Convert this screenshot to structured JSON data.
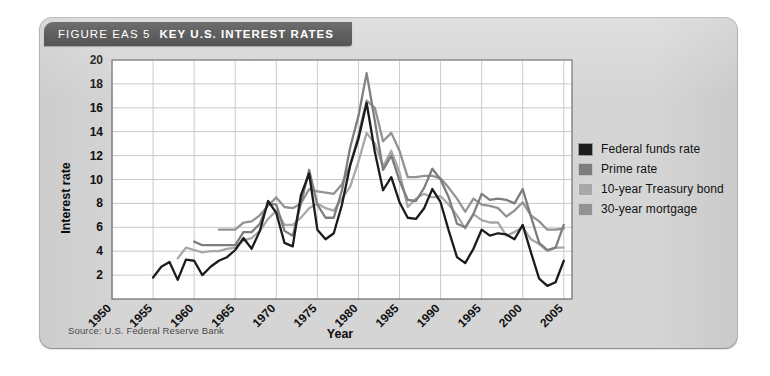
{
  "figure": {
    "label": "FIGURE EAS 5",
    "title": "KEY U.S. INTEREST RATES",
    "source": "Source: U.S. Federal Reserve Bank",
    "card_color": "#d5d5d5",
    "titlebar_color": "#5e5e5e",
    "plot_background": "#ffffff"
  },
  "legend": {
    "position": "right",
    "items": [
      {
        "label": "Federal funds rate",
        "color": "#1c1c1c"
      },
      {
        "label": "Prime rate",
        "color": "#7d7d7d"
      },
      {
        "label": "10-year Treasury bond",
        "color": "#a8a8a8"
      },
      {
        "label": "30-year mortgage",
        "color": "#929292"
      }
    ]
  },
  "chart_data": {
    "type": "line",
    "title": "KEY U.S. INTEREST RATES",
    "xlabel": "Year",
    "ylabel": "Interest rate",
    "xlim": [
      1950,
      2006
    ],
    "ylim": [
      0,
      20
    ],
    "grid": true,
    "xticks": [
      1950,
      1955,
      1960,
      1965,
      1970,
      1975,
      1980,
      1985,
      1990,
      1995,
      2000,
      2005
    ],
    "yticks": [
      2,
      4,
      6,
      8,
      10,
      12,
      14,
      16,
      18,
      20
    ],
    "xtick_rotation": 45,
    "series": [
      {
        "name": "Federal funds rate",
        "color": "#1c1c1c",
        "x": [
          1955,
          1956,
          1957,
          1958,
          1959,
          1960,
          1961,
          1962,
          1963,
          1964,
          1965,
          1966,
          1967,
          1968,
          1969,
          1970,
          1971,
          1972,
          1973,
          1974,
          1975,
          1976,
          1977,
          1978,
          1979,
          1980,
          1981,
          1982,
          1983,
          1984,
          1985,
          1986,
          1987,
          1988,
          1989,
          1990,
          1991,
          1992,
          1993,
          1994,
          1995,
          1996,
          1997,
          1998,
          1999,
          2000,
          2001,
          2002,
          2003,
          2004,
          2005
        ],
        "y": [
          1.8,
          2.7,
          3.1,
          1.6,
          3.3,
          3.2,
          2.0,
          2.7,
          3.2,
          3.5,
          4.1,
          5.1,
          4.2,
          5.7,
          8.2,
          7.2,
          4.7,
          4.4,
          8.7,
          10.5,
          5.8,
          5.0,
          5.5,
          7.9,
          11.2,
          13.4,
          16.4,
          12.3,
          9.1,
          10.2,
          8.1,
          6.8,
          6.7,
          7.6,
          9.2,
          8.1,
          5.7,
          3.5,
          3.0,
          4.2,
          5.8,
          5.3,
          5.5,
          5.4,
          5.0,
          6.2,
          3.9,
          1.7,
          1.1,
          1.4,
          3.2
        ]
      },
      {
        "name": "Prime rate",
        "color": "#7d7d7d",
        "x": [
          1960,
          1961,
          1962,
          1963,
          1964,
          1965,
          1966,
          1967,
          1968,
          1969,
          1970,
          1971,
          1972,
          1973,
          1974,
          1975,
          1976,
          1977,
          1978,
          1979,
          1980,
          1981,
          1982,
          1983,
          1984,
          1985,
          1986,
          1987,
          1988,
          1989,
          1990,
          1991,
          1992,
          1993,
          1994,
          1995,
          1996,
          1997,
          1998,
          1999,
          2000,
          2001,
          2002,
          2003,
          2004,
          2005
        ],
        "y": [
          4.8,
          4.5,
          4.5,
          4.5,
          4.5,
          4.5,
          5.6,
          5.6,
          6.3,
          8.0,
          7.9,
          5.7,
          5.3,
          8.0,
          10.8,
          7.9,
          6.8,
          6.8,
          9.1,
          12.7,
          15.3,
          18.9,
          14.9,
          10.8,
          12.0,
          9.9,
          8.3,
          8.2,
          9.3,
          10.9,
          10.0,
          8.5,
          6.3,
          6.0,
          7.1,
          8.8,
          8.3,
          8.4,
          8.3,
          8.0,
          9.2,
          6.9,
          4.7,
          4.1,
          4.3,
          6.2
        ]
      },
      {
        "name": "10-year Treasury bond",
        "color": "#a8a8a8",
        "x": [
          1958,
          1959,
          1960,
          1961,
          1962,
          1963,
          1964,
          1965,
          1966,
          1967,
          1968,
          1969,
          1970,
          1971,
          1972,
          1973,
          1974,
          1975,
          1976,
          1977,
          1978,
          1979,
          1980,
          1981,
          1982,
          1983,
          1984,
          1985,
          1986,
          1987,
          1988,
          1989,
          1990,
          1991,
          1992,
          1993,
          1994,
          1995,
          1996,
          1997,
          1998,
          1999,
          2000,
          2001,
          2002,
          2003,
          2004,
          2005
        ],
        "y": [
          3.4,
          4.3,
          4.1,
          3.9,
          4.0,
          4.0,
          4.2,
          4.3,
          4.9,
          5.1,
          5.7,
          6.7,
          7.4,
          6.2,
          6.2,
          6.8,
          7.6,
          8.0,
          7.6,
          7.4,
          8.4,
          9.4,
          11.5,
          13.9,
          13.0,
          11.1,
          12.4,
          10.6,
          7.7,
          8.4,
          8.8,
          8.5,
          8.6,
          7.9,
          7.0,
          5.9,
          7.1,
          6.6,
          6.4,
          6.4,
          5.3,
          5.6,
          6.0,
          5.0,
          4.6,
          4.0,
          4.3,
          4.3
        ]
      },
      {
        "name": "30-year mortgage",
        "color": "#929292",
        "x": [
          1963,
          1964,
          1965,
          1966,
          1967,
          1968,
          1969,
          1970,
          1971,
          1972,
          1973,
          1974,
          1975,
          1976,
          1977,
          1978,
          1979,
          1980,
          1981,
          1982,
          1983,
          1984,
          1985,
          1986,
          1987,
          1988,
          1989,
          1990,
          1991,
          1992,
          1993,
          1994,
          1995,
          1996,
          1997,
          1998,
          1999,
          2000,
          2001,
          2002,
          2003,
          2004,
          2005
        ],
        "y": [
          5.8,
          5.8,
          5.8,
          6.4,
          6.5,
          7.0,
          7.8,
          8.5,
          7.7,
          7.6,
          8.0,
          9.2,
          9.0,
          8.9,
          8.8,
          9.6,
          11.2,
          13.7,
          16.6,
          16.0,
          13.2,
          13.9,
          12.4,
          10.2,
          10.2,
          10.3,
          10.3,
          10.1,
          9.3,
          8.4,
          7.3,
          8.4,
          7.9,
          7.8,
          7.6,
          6.9,
          7.4,
          8.1,
          7.0,
          6.5,
          5.8,
          5.8,
          5.9
        ]
      }
    ]
  }
}
